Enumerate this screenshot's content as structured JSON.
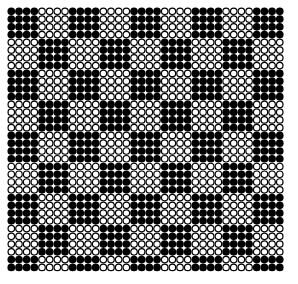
{
  "pattern": {
    "description": "Checkerboard of 4x4 blocks of circles, alternating filled and hollow",
    "columns": 36,
    "rows": 34,
    "block_size": 4,
    "first_block": "filled",
    "origin_x": 11.3,
    "origin_y": 11.3,
    "pitch_x": 7.67,
    "pitch_y": 7.76,
    "radius": 3.25,
    "stroke_width": 1.2,
    "filled_color": "#000000",
    "hollow_stroke_color": "#000000",
    "hollow_fill_color": "#ffffff",
    "background": "#ffffff"
  }
}
